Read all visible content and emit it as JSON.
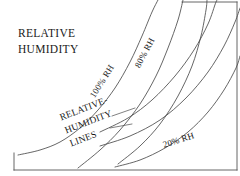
{
  "figure": {
    "title_lines": [
      "RELATIVE",
      "HUMIDITY"
    ],
    "background_color": "#ffffff",
    "line_color": "#4a4a4a",
    "frame_color": "#555555",
    "text_color": "#171717"
  },
  "labels": {
    "rh_100": "100% RH",
    "rh_80": "80% RH",
    "rh_20": "20% RH",
    "lines_annotation": [
      "RELATIVE-",
      "HUMIDITY",
      "LINES"
    ]
  },
  "chart_data": {
    "type": "line",
    "title": "RELATIVE HUMIDITY",
    "subtitle": "",
    "xlabel": "",
    "ylabel": "",
    "xlim": [
      0,
      240
    ],
    "ylim": [
      0,
      176
    ],
    "grid": false,
    "legend_position": "inline-curve-labels",
    "annotations": [
      {
        "text": "RELATIVE",
        "x": 18,
        "y": 30,
        "rotation": 0
      },
      {
        "text": "HUMIDITY",
        "x": 18,
        "y": 45,
        "rotation": 0
      },
      {
        "text": "100% RH",
        "x": 92,
        "y": 92,
        "rotation": -58
      },
      {
        "text": "80% RH",
        "x": 137,
        "y": 62,
        "rotation": -62
      },
      {
        "text": "20% RH",
        "x": 163,
        "y": 142,
        "rotation": -18
      },
      {
        "text": "RELATIVE-",
        "x": 58,
        "y": 115,
        "rotation": -21
      },
      {
        "text": "HUMIDITY",
        "x": 64,
        "y": 130,
        "rotation": -21
      },
      {
        "text": "LINES",
        "x": 70,
        "y": 146,
        "rotation": -21
      }
    ],
    "series": [
      {
        "name": "100% RH",
        "label": "100% RH",
        "labeled": true,
        "points": [
          [
            18,
            155
          ],
          [
            40,
            150
          ],
          [
            60,
            142
          ],
          [
            80,
            128
          ],
          [
            98,
            110
          ],
          [
            115,
            88
          ],
          [
            130,
            62
          ],
          [
            142,
            36
          ],
          [
            152,
            12
          ],
          [
            158,
            0
          ]
        ]
      },
      {
        "name": "80% RH",
        "label": "80% RH",
        "labeled": true,
        "points": [
          [
            78,
            168
          ],
          [
            100,
            150
          ],
          [
            120,
            130
          ],
          [
            140,
            104
          ],
          [
            156,
            76
          ],
          [
            168,
            48
          ],
          [
            178,
            20
          ],
          [
            183,
            0
          ]
        ]
      },
      {
        "name": "intermediate-curve-1",
        "label": "",
        "labeled": false,
        "points": [
          [
            118,
            164
          ],
          [
            140,
            146
          ],
          [
            160,
            124
          ],
          [
            178,
            96
          ],
          [
            192,
            66
          ],
          [
            201,
            36
          ],
          [
            206,
            10
          ],
          [
            207,
            0
          ]
        ]
      },
      {
        "name": "intermediate-curve-2",
        "label": "",
        "labeled": false,
        "points": [
          [
            100,
            132
          ],
          [
            128,
            118
          ],
          [
            152,
            100
          ],
          [
            175,
            76
          ],
          [
            194,
            50
          ],
          [
            208,
            24
          ],
          [
            216,
            2
          ],
          [
            218,
            0
          ]
        ]
      },
      {
        "name": "intermediate-curve-3",
        "label": "",
        "labeled": false,
        "points": [
          [
            100,
            146
          ],
          [
            130,
            136
          ],
          [
            160,
            120
          ],
          [
            186,
            98
          ],
          [
            208,
            72
          ],
          [
            224,
            46
          ],
          [
            235,
            22
          ],
          [
            240,
            8
          ]
        ]
      },
      {
        "name": "20% RH",
        "label": "20% RH",
        "labeled": true,
        "points": [
          [
            115,
            167
          ],
          [
            140,
            160
          ],
          [
            165,
            148
          ],
          [
            188,
            132
          ],
          [
            208,
            112
          ],
          [
            224,
            90
          ],
          [
            236,
            68
          ],
          [
            240,
            56
          ]
        ]
      }
    ],
    "leader_lines": [
      {
        "from": [
          112,
          116
        ],
        "to": [
          135,
          108
        ]
      },
      {
        "from": [
          110,
          128
        ],
        "to": [
          132,
          124
        ]
      }
    ],
    "frame": {
      "top_edge": {
        "from": [
          182,
          2
        ],
        "to": [
          237,
          2
        ]
      },
      "right_edge": {
        "from": [
          237,
          2
        ],
        "to": [
          237,
          170
        ]
      },
      "bottom_edge": {
        "from": [
          14,
          170
        ],
        "to": [
          237,
          170
        ]
      },
      "left_stub": {
        "from": [
          14,
          153
        ],
        "to": [
          14,
          170
        ]
      }
    }
  }
}
